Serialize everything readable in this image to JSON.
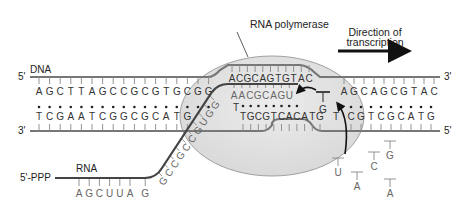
{
  "diagram": {
    "title_label": "RNA polymerase",
    "direction_label_line1": "Direction of",
    "direction_label_line2": "transcription",
    "dna_label": "DNA",
    "rna_label": "RNA",
    "rna_5prime": "5'-PPP",
    "ends": {
      "top_left": "5'",
      "bottom_left": "3'",
      "top_right": "3'",
      "bottom_right": "5'"
    },
    "top_strand_left": [
      "A",
      "G",
      "C",
      "T",
      "T",
      "A",
      "G",
      "C",
      "C",
      "G",
      "C",
      "G",
      "T",
      "G",
      "C",
      "G",
      "G"
    ],
    "bottom_strand_left": [
      "T",
      "C",
      "G",
      "A",
      "A",
      "T",
      "C",
      "G",
      "G",
      "C",
      "G",
      "C",
      "A",
      "T",
      "G"
    ],
    "bubble_top": [
      "A",
      "C",
      "G",
      "C",
      "A",
      "G",
      "T",
      "G",
      "T",
      "A",
      "C"
    ],
    "bubble_template": [
      "T",
      "G",
      "C",
      "G",
      "T",
      "C",
      "A",
      "C",
      "A",
      "T",
      "G"
    ],
    "rna_hybrid": [
      "A",
      "A",
      "C",
      "G",
      "C",
      "A",
      "G",
      "U"
    ],
    "rna_exit": [
      "G",
      "C",
      "C",
      "G",
      "C",
      "C",
      "G",
      "U",
      "G",
      "G"
    ],
    "rna_flat": [
      "A",
      "G",
      "C",
      "U",
      "U",
      "A",
      "G"
    ],
    "top_strand_right": [
      "A",
      "G",
      "C",
      "A",
      "G",
      "C",
      "G",
      "T",
      "A",
      "C"
    ],
    "bottom_strand_right": [
      "C",
      "G",
      "T",
      "C",
      "G",
      "C",
      "A",
      "T",
      "G"
    ],
    "incoming_nucleotide": "G",
    "template_base_at_site": "T",
    "free_nucleotides": [
      "U",
      "A",
      "C",
      "G",
      "A"
    ],
    "colors": {
      "polymerase_fill": "#e3e3e3",
      "polymerase_stroke": "#9a9a9a",
      "strand": "#777777",
      "rna": "#444444",
      "arrow": "#111111"
    }
  }
}
